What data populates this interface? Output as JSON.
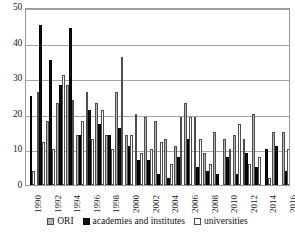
{
  "chart_data": {
    "type": "bar",
    "title": "",
    "xlabel": "",
    "ylabel": "",
    "ylim": [
      0,
      50
    ],
    "yticks": [
      0,
      10,
      20,
      30,
      40,
      50
    ],
    "grid": true,
    "legend_position": "bottom",
    "categories": [
      "1990",
      "1991",
      "1992",
      "1993",
      "1994",
      "1995",
      "1996",
      "1997",
      "1998",
      "1999",
      "2000",
      "2001",
      "2002",
      "2003",
      "2004",
      "2005",
      "2006",
      "2007",
      "2008",
      "2009",
      "2010",
      "2011",
      "2012",
      "2013",
      "2014",
      "2015",
      "2016"
    ],
    "tick_labels": [
      "1990",
      "",
      "1992",
      "",
      "1994",
      "",
      "1996",
      "",
      "1998",
      "",
      "2000",
      "",
      "2002",
      "",
      "2004",
      "",
      "2006",
      "",
      "2008",
      "",
      "2010",
      "",
      "2012",
      "",
      "2014",
      "",
      "2016"
    ],
    "series": [
      {
        "name": "ORI",
        "color": "#b3b3b3",
        "values": [
          0,
          26,
          18,
          23,
          28,
          14,
          26,
          23,
          14,
          26,
          14,
          20,
          19,
          18,
          13,
          11,
          23,
          19,
          9,
          15,
          13,
          14,
          13,
          20,
          0,
          15,
          15
        ]
      },
      {
        "name": "academies and institutes",
        "color": "#0d0d0d",
        "values": [
          25,
          45,
          35,
          28,
          44,
          14,
          21,
          17,
          14,
          16,
          11,
          7,
          7,
          3,
          2,
          8,
          13,
          5,
          4,
          3,
          8,
          3,
          9,
          5,
          10,
          11,
          4
        ]
      },
      {
        "name": "universities",
        "color": "#ffffff",
        "values": [
          4,
          12,
          10,
          31,
          24,
          18,
          13,
          21,
          10,
          36,
          14,
          9,
          10,
          12,
          6,
          19,
          19,
          13,
          6,
          0,
          10,
          17,
          6,
          8,
          2,
          0,
          10
        ]
      }
    ]
  },
  "legend": {
    "items": [
      {
        "label": "ORI",
        "key": "ori"
      },
      {
        "label": "academies and institutes",
        "key": "acad"
      },
      {
        "label": "universities",
        "key": "univ"
      }
    ]
  }
}
